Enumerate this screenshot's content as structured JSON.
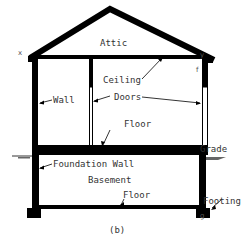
{
  "figure": {
    "caption": "(b)",
    "colors": {
      "structure": "#000000",
      "text": "#333333",
      "background": "#ffffff"
    },
    "labels": {
      "attic": "Attic",
      "ceiling": "Ceiling",
      "wall": "Wall",
      "doors": "Doors",
      "floor_upper": "Floor",
      "grade": "Grade",
      "foundation_wall": "Foundation Wall",
      "basement": "Basement",
      "floor_lower": "Floor",
      "footing": "Footing"
    },
    "point_markers": {
      "x": "x",
      "y": "y",
      "f": "f",
      "g": "g"
    }
  }
}
